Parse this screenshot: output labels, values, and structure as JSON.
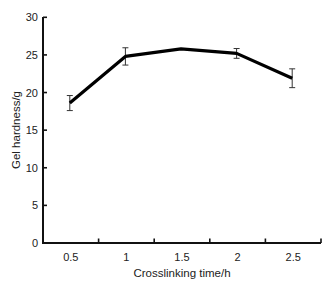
{
  "chart_data": {
    "type": "line",
    "title": "",
    "xlabel": "Crosslinking time/h",
    "ylabel": "Gel hardness/g",
    "categories": [
      "0.5",
      "1",
      "1.5",
      "2",
      "2.5"
    ],
    "x": [
      0.5,
      1,
      1.5,
      2,
      2.5
    ],
    "values": [
      18.6,
      24.8,
      25.8,
      25.2,
      21.9
    ],
    "error": [
      1.0,
      1.15,
      0.15,
      0.65,
      1.25
    ],
    "series": [
      {
        "name": "Gel hardness",
        "values": [
          18.6,
          24.8,
          25.8,
          25.2,
          21.9
        ],
        "error": [
          1.0,
          1.15,
          0.15,
          0.65,
          1.25
        ],
        "color": "#000000"
      }
    ],
    "ylim": [
      0,
      30
    ],
    "yticks": [
      0,
      5,
      10,
      15,
      20,
      25,
      30
    ],
    "grid": false,
    "legend": "none"
  },
  "axes": {
    "xlabel": "Crosslinking time/h",
    "ylabel": "Gel hardness/g",
    "xtick_labels": [
      "0.5",
      "1",
      "1.5",
      "2",
      "2.5"
    ],
    "ytick_labels": [
      "0",
      "5",
      "10",
      "15",
      "20",
      "25",
      "30"
    ]
  }
}
